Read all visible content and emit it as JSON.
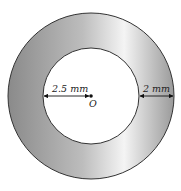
{
  "diagram": {
    "type": "annulus",
    "center_label": "O",
    "inner_radius_label": "2.5 mm",
    "ring_width_label": "2 mm",
    "colors": {
      "ring_dark": "#8c8c8c",
      "ring_light": "#f2f2f2",
      "stroke": "#333333",
      "inner_fill": "#ffffff"
    }
  }
}
